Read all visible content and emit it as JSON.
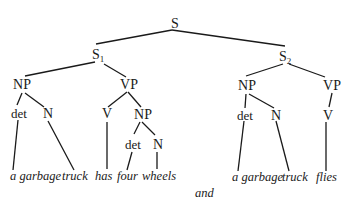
{
  "diagram": {
    "type": "syntax-tree",
    "nodes": {
      "root": "S",
      "s1": "S",
      "s1_sub": "1",
      "s2": "S",
      "s2_sub": "2",
      "np1": "NP",
      "vp1": "VP",
      "det1": "det",
      "n1": "N",
      "v1": "V",
      "np2": "NP",
      "det2": "det",
      "n2": "N",
      "np3": "NP",
      "vp2": "VP",
      "det3": "det",
      "n3": "N",
      "v2": "V"
    },
    "sentence1": {
      "w1": "a garbage",
      "w2": "truck",
      "w3": "has",
      "w4": "four",
      "w5": "wheels"
    },
    "sentence2": {
      "w1": "a garbage",
      "w2": "truck",
      "w3": "flies"
    },
    "conjunction": "and"
  }
}
